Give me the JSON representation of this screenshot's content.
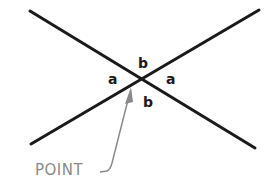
{
  "diagram": {
    "angle_labels": {
      "top": "b",
      "left": "a",
      "right": "a",
      "bottom": "b"
    },
    "callout": "POINT",
    "colors": {
      "lines": "#1a1a1a",
      "callout": "#8a8a8a"
    }
  }
}
